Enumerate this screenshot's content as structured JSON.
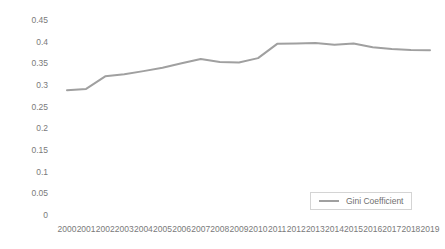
{
  "chart_data": {
    "type": "line",
    "title": "",
    "xlabel": "",
    "ylabel": "",
    "grid": false,
    "legend_position": "bottom-right",
    "categories": [
      "2000",
      "2001",
      "2002",
      "2003",
      "2004",
      "2005",
      "2006",
      "2007",
      "2008",
      "2009",
      "2010",
      "2011",
      "2012",
      "2013",
      "2014",
      "2015",
      "2016",
      "2017",
      "2018",
      "2019"
    ],
    "x": [
      2000,
      2001,
      2002,
      2003,
      2004,
      2005,
      2006,
      2007,
      2008,
      2009,
      2010,
      2011,
      2012,
      2013,
      2014,
      2015,
      2016,
      2017,
      2018,
      2019
    ],
    "series": [
      {
        "name": "Gini Coefficient",
        "color": "#a0a0a0",
        "values": [
          0.288,
          0.291,
          0.32,
          0.325,
          0.332,
          0.34,
          0.35,
          0.36,
          0.353,
          0.352,
          0.362,
          0.395,
          0.396,
          0.397,
          0.393,
          0.396,
          0.387,
          0.383,
          0.381,
          0.38
        ]
      }
    ],
    "ylim": [
      0,
      0.45
    ],
    "yticks": [
      0,
      0.05,
      0.1,
      0.15,
      0.2,
      0.25,
      0.3,
      0.35,
      0.4,
      0.45
    ],
    "ytick_labels": [
      "0",
      "0.05",
      "0.1",
      "0.15",
      "0.2",
      "0.25",
      "0.3",
      "0.35",
      "0.4",
      "0.45"
    ],
    "xtick_labels": [
      "2000",
      "2001",
      "2002",
      "2003",
      "2004",
      "2005",
      "2006",
      "2007",
      "2008",
      "2009",
      "2010",
      "2011",
      "2012",
      "2013",
      "2014",
      "2015",
      "2016",
      "2017",
      "2018",
      "2019"
    ]
  },
  "legend": {
    "entries": [
      {
        "label": "Gini Coefficient",
        "swatch": "line-swatch-icon"
      }
    ]
  },
  "colors": {
    "series_line": "#a0a0a0",
    "tick_text": "#7a7a7a",
    "legend_border": "#d4d4d4",
    "background": "#ffffff"
  }
}
